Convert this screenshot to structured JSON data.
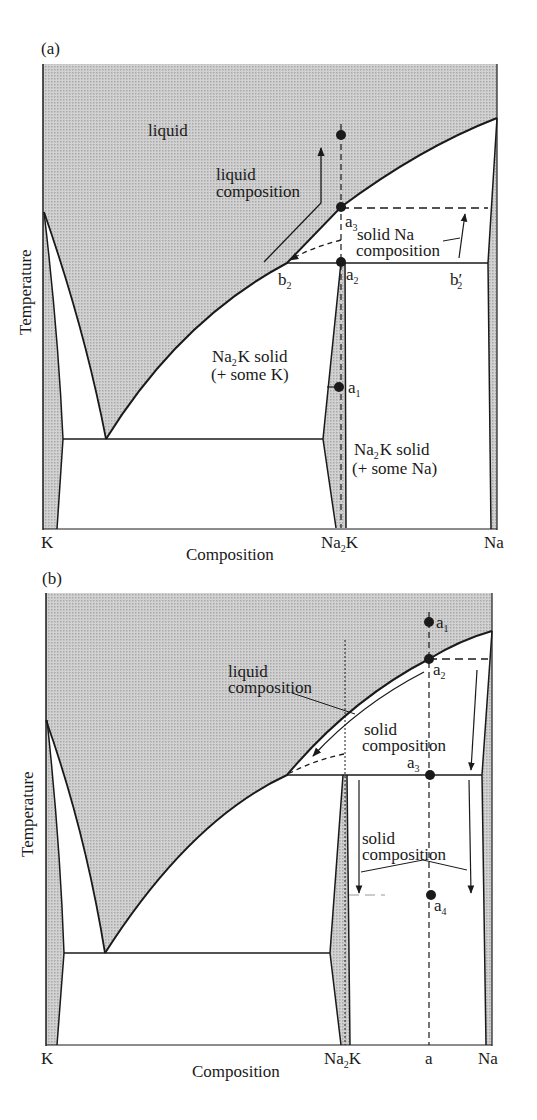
{
  "figure": {
    "type": "phase-diagram",
    "colors": {
      "shading": "#c8c8c8",
      "line": "#1a1a1a",
      "background": "#ffffff"
    }
  },
  "panel_a": {
    "label": "(a)",
    "y_axis_label": "Temperature",
    "x_axis_label": "Composition",
    "x_ticks": [
      "K",
      "Na",
      "K",
      "Na"
    ],
    "x_tick_K": "K",
    "x_tick_Na2K_main": "Na",
    "x_tick_Na2K_sub": "2",
    "x_tick_Na2K_end": "K",
    "x_tick_Na": "Na",
    "region_liquid": "liquid",
    "annot_liquid_comp_1": "liquid",
    "annot_liquid_comp_2": "composition",
    "annot_solid_na_1": "solid Na",
    "annot_solid_na_2": "composition",
    "annot_na2k_k_1a": "Na",
    "annot_na2k_k_1b": "2",
    "annot_na2k_k_1c": "K solid",
    "annot_na2k_k_2": "(+ some K)",
    "annot_na2k_na_1a": "Na",
    "annot_na2k_na_1b": "2",
    "annot_na2k_na_1c": "K solid",
    "annot_na2k_na_2": "(+ some Na)",
    "points": {
      "a1": {
        "base": "a",
        "sub": "1"
      },
      "a2": {
        "base": "a",
        "sub": "2"
      },
      "a3": {
        "base": "a",
        "sub": "3"
      },
      "b2": {
        "base": "b",
        "sub": "2"
      },
      "b2p": {
        "base": "b",
        "sub": "2",
        "prime": "′"
      }
    }
  },
  "panel_b": {
    "label": "(b)",
    "y_axis_label": "Temperature",
    "x_axis_label": "Composition",
    "x_tick_K": "K",
    "x_tick_Na2K_main": "Na",
    "x_tick_Na2K_sub": "2",
    "x_tick_Na2K_end": "K",
    "x_tick_a": "a",
    "x_tick_Na": "Na",
    "annot_liquid_comp_1": "liquid",
    "annot_liquid_comp_2": "composition",
    "annot_solid_comp_upper_1": "solid",
    "annot_solid_comp_upper_2": "composition",
    "annot_solid_comp_lower_1": "solid",
    "annot_solid_comp_lower_2": "composition",
    "points": {
      "a1": {
        "base": "a",
        "sub": "1"
      },
      "a2": {
        "base": "a",
        "sub": "2"
      },
      "a3": {
        "base": "a",
        "sub": "3"
      },
      "a4": {
        "base": "a",
        "sub": "4"
      }
    }
  }
}
